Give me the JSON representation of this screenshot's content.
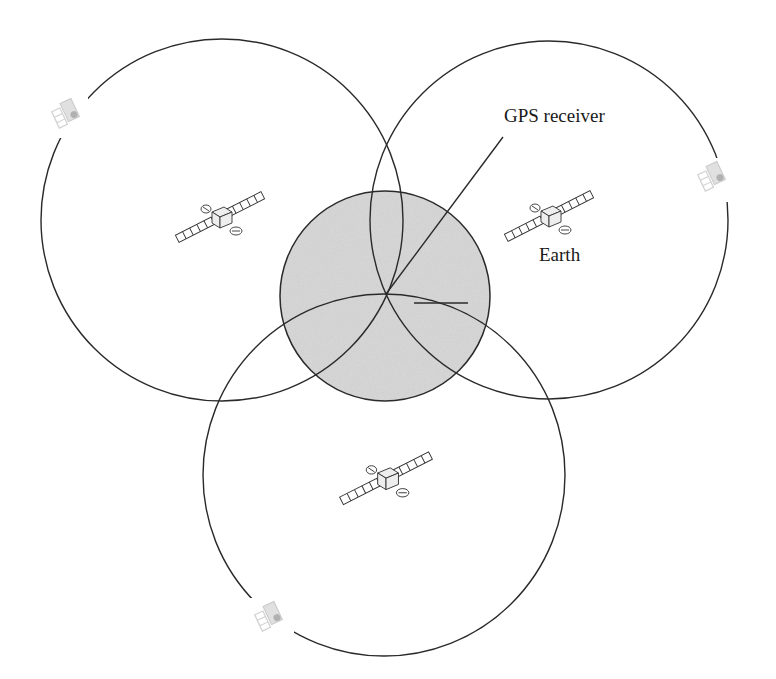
{
  "diagram": {
    "labels": {
      "gps_receiver": "GPS receiver",
      "earth": "Earth"
    },
    "colors": {
      "background": "#ffffff",
      "stroke": "#2a2a2a",
      "earth_fill": "#d6d6d6"
    },
    "earth": {
      "cx": 385,
      "cy": 296,
      "r": 105
    },
    "coverage_circles": [
      {
        "id": "left",
        "cx": 222,
        "cy": 220,
        "r": 181
      },
      {
        "id": "right",
        "cx": 549,
        "cy": 220,
        "r": 179
      },
      {
        "id": "bottom",
        "cx": 384,
        "cy": 475,
        "r": 181
      }
    ],
    "receiver_point": {
      "x": 386,
      "y": 294
    },
    "leader_line": {
      "x1": 386,
      "y1": 294,
      "x2": 503,
      "y2": 137
    },
    "radius_marker": {
      "x1": 414,
      "y1": 303,
      "x2": 468,
      "y2": 303
    },
    "satellites": [
      {
        "id": "sat-left",
        "x": 172,
        "y": 188,
        "w": 96,
        "h": 58
      },
      {
        "id": "sat-right",
        "x": 500,
        "y": 187,
        "w": 97,
        "h": 58
      },
      {
        "id": "sat-bottom",
        "x": 333,
        "y": 447,
        "w": 102,
        "h": 58
      }
    ],
    "small_satellites": [
      {
        "id": "small-sat-top-left",
        "x": 52,
        "y": 100
      },
      {
        "id": "small-sat-right",
        "x": 698,
        "y": 162
      },
      {
        "id": "small-sat-bottom-left",
        "x": 255,
        "y": 602
      }
    ]
  }
}
